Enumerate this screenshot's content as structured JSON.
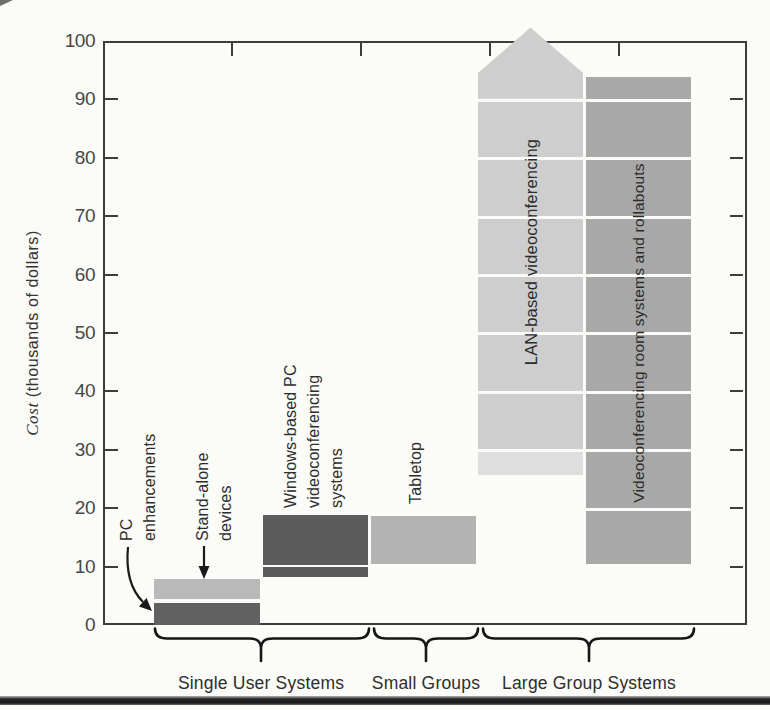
{
  "figure": {
    "background": "#fbfbf8",
    "frame_color": "#3d3d3d",
    "bottom_rule_color": "#242424"
  },
  "chart_data": {
    "type": "bar",
    "subtype": "floating-range-bars-stacked",
    "title": "",
    "ylabel_italic": "Cost",
    "ylabel_rest": " (thousands of dollars)",
    "ylim": [
      0,
      100
    ],
    "y_ticks": [
      0,
      10,
      20,
      30,
      40,
      50,
      60,
      70,
      80,
      90,
      100
    ],
    "grid": false,
    "legend": "none",
    "groups": [
      {
        "label": "Single User Systems",
        "bar_ids": [
          "pc-enhancements",
          "stand-alone-devices",
          "windows-pc-videoconferencing"
        ]
      },
      {
        "label": "Small Groups",
        "bar_ids": [
          "tabletop"
        ]
      },
      {
        "label": "Large Group Systems",
        "bar_ids": [
          "lan-based-videoconferencing",
          "videoconferencing-room-systems"
        ]
      }
    ],
    "bars": [
      {
        "id": "pc-enhancements",
        "slot": "single-user",
        "label": "PC enhancements",
        "label_lines": [
          "PC",
          "enhancements"
        ],
        "label_style": "callout",
        "color": "#616161",
        "segments": [
          [
            0,
            3.8
          ]
        ],
        "cost_range_k": [
          0,
          4
        ]
      },
      {
        "id": "stand-alone-devices",
        "slot": "single-user",
        "label": "Stand-alone devices",
        "label_lines": [
          "Stand-alone",
          "devices"
        ],
        "label_style": "callout",
        "color": "#b9b9b9",
        "segments": [
          [
            4.4,
            7.9
          ]
        ],
        "cost_range_k": [
          4.5,
          8
        ]
      },
      {
        "id": "windows-pc-videoconferencing",
        "slot": "windows",
        "label": "Windows-based PC videoconferencing systems",
        "label_lines": [
          "Windows-based PC",
          "videoconferencing",
          "systems"
        ],
        "label_style": "above",
        "color": "#5c5c5c",
        "segments": [
          [
            8.3,
            9.9
          ],
          [
            10.3,
            18.8
          ]
        ],
        "cost_range_k": [
          8,
          19
        ]
      },
      {
        "id": "tabletop",
        "slot": "tabletop",
        "label": "Tabletop",
        "label_lines": [
          "Tabletop"
        ],
        "label_style": "above",
        "color": "#b3b3b3",
        "segments": [
          [
            10.4,
            18.6
          ]
        ],
        "cost_range_k": [
          10,
          18.5
        ]
      },
      {
        "id": "lan-based-videoconferencing",
        "slot": "lan",
        "label": "LAN-based videoconferencing",
        "label_style": "inside",
        "label_font_px": 16.5,
        "color": "#cecece",
        "segment_colors": {
          "0": "#dedede"
        },
        "segments": [
          [
            25.6,
            29.7
          ],
          [
            30.2,
            39.6
          ],
          [
            40.1,
            49.6
          ],
          [
            50.1,
            59.6
          ],
          [
            60.1,
            69.6
          ],
          [
            70.1,
            79.6
          ],
          [
            80.1,
            89.6
          ],
          [
            90.1,
            102.3
          ]
        ],
        "arrow_top": {
          "segment_index": 7,
          "shoulder_value": 94.5,
          "meaning": "cost extends beyond chart maximum of 100"
        },
        "cost_range_k": [
          25.5,
          100
        ]
      },
      {
        "id": "videoconferencing-room-systems",
        "slot": "room",
        "label": "Videoconferencing room systems and rollabouts",
        "label_style": "inside",
        "label_font_px": 15.5,
        "color": "#a8a8a8",
        "segments": [
          [
            10.4,
            19.5
          ],
          [
            20.0,
            29.6
          ],
          [
            30.1,
            39.6
          ],
          [
            40.1,
            49.6
          ],
          [
            50.1,
            59.6
          ],
          [
            60.1,
            69.6
          ],
          [
            70.1,
            79.6
          ],
          [
            80.1,
            89.6
          ],
          [
            90.1,
            93.8
          ]
        ],
        "cost_range_k": [
          10,
          93.5
        ]
      }
    ]
  }
}
